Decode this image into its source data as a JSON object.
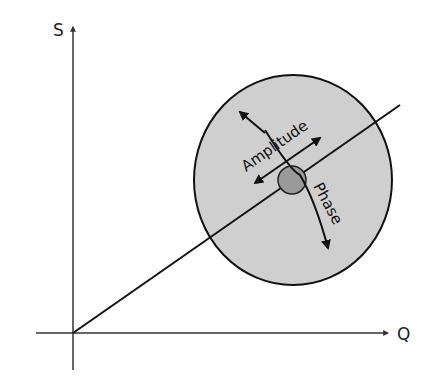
{
  "diagram": {
    "type": "IQ constellation / phase-amplitude error diagram",
    "axes": {
      "x_label": "Q",
      "y_label": "S"
    },
    "labels": {
      "amplitude": "Amplitude",
      "phase": "Phase"
    },
    "colors": {
      "background": "#ffffff",
      "stroke": "#111111",
      "outer_circle_fill": "#cfcfcf",
      "inner_circle_fill": "#9a9a9a"
    },
    "geometry": {
      "origin": [
        73,
        333
      ],
      "outer_circle": {
        "cx": 293,
        "cy": 180,
        "rx": 99,
        "ry": 105
      },
      "inner_circle": {
        "cx": 292,
        "cy": 180,
        "r": 14
      },
      "vector_end": [
        400,
        105
      ]
    }
  }
}
